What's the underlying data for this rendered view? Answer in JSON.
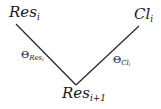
{
  "diagram": {
    "type": "angle-diagram",
    "nodes": {
      "res_i": {
        "base": "Res",
        "sub": "i"
      },
      "cl_i": {
        "base": "Cl",
        "sub": "i"
      },
      "res_i1": {
        "base": "Res",
        "sub": "i+1"
      }
    },
    "angles": {
      "theta_res": {
        "symbol": "Θ",
        "sub_base": "Res",
        "sub_sub": "i"
      },
      "theta_cl": {
        "symbol": "Θ",
        "sub_base": "Cl",
        "sub_sub": "i"
      }
    },
    "edges": [
      {
        "from": "res_i",
        "to": "res_i1"
      },
      {
        "from": "cl_i",
        "to": "res_i1"
      }
    ],
    "colors": {
      "line": "#2a2a2a",
      "text": "#1a1a1a",
      "background": "#ffffff"
    }
  }
}
